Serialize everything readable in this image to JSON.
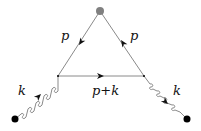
{
  "diagram": {
    "type": "feynman-diagram",
    "labels": {
      "left_fermion": "p",
      "right_fermion": "p",
      "bottom_fermion": "p+k",
      "left_gluon": "k",
      "right_gluon": "k"
    },
    "colors": {
      "line": "#8a8a8a",
      "arrow": "#111111",
      "top_vertex": "#808080",
      "external_dot": "#000000"
    }
  }
}
